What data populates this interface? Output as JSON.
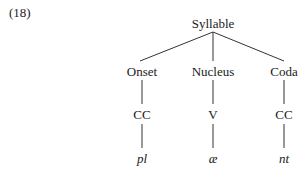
{
  "example_number": "(18)",
  "tree": {
    "root": {
      "label": "Syllable"
    },
    "constituents": [
      {
        "label": "Onset",
        "skeleton": "CC",
        "segments": "pl"
      },
      {
        "label": "Nucleus",
        "skeleton": "V",
        "segments": "æ"
      },
      {
        "label": "Coda",
        "skeleton": "CC",
        "segments": "nt"
      }
    ]
  }
}
